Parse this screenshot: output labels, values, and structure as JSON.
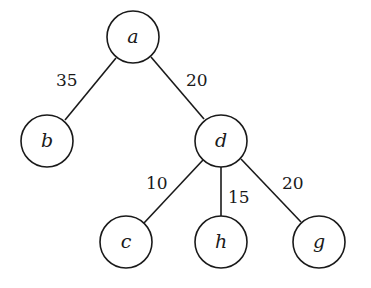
{
  "diagram": {
    "type": "weighted-tree",
    "nodes": [
      {
        "id": "a",
        "label": "a",
        "x": 133,
        "y": 37
      },
      {
        "id": "b",
        "label": "b",
        "x": 47,
        "y": 141
      },
      {
        "id": "d",
        "label": "d",
        "x": 221,
        "y": 141
      },
      {
        "id": "c",
        "label": "c",
        "x": 126,
        "y": 242
      },
      {
        "id": "h",
        "label": "h",
        "x": 221,
        "y": 242
      },
      {
        "id": "g",
        "label": "g",
        "x": 319,
        "y": 242
      }
    ],
    "edges": [
      {
        "from": "a",
        "to": "b",
        "weight": "35"
      },
      {
        "from": "a",
        "to": "d",
        "weight": "20"
      },
      {
        "from": "d",
        "to": "c",
        "weight": "10"
      },
      {
        "from": "d",
        "to": "h",
        "weight": "15"
      },
      {
        "from": "d",
        "to": "g",
        "weight": "20"
      }
    ]
  }
}
